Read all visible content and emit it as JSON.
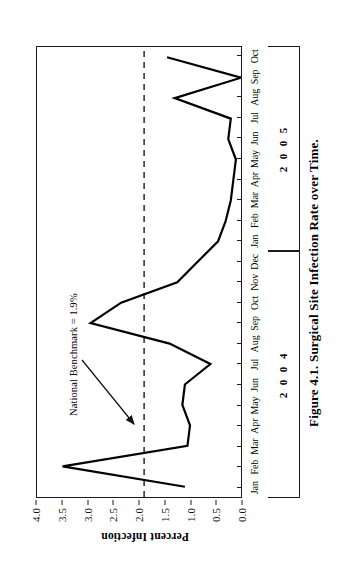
{
  "caption": "Figure 4.1.  Surgical Site Infection Rate over Time.",
  "axes": {
    "y_title": "Percent Infection",
    "y_ticks": [
      "0.0",
      "0.5",
      "1.0",
      "1.5",
      "2.0",
      "2.5",
      "3.0",
      "3.5",
      "4.0"
    ]
  },
  "annotation": {
    "benchmark_label": "National Benchmark = 1.9%"
  },
  "years": [
    {
      "label": "2 0 0 4",
      "months": 12
    },
    {
      "label": "2 0 0 5",
      "months": 10
    }
  ],
  "chart_data": {
    "type": "line",
    "title": "Surgical Site Infection Rate over Time",
    "xlabel": "",
    "ylabel": "Percent Infection",
    "ylim": [
      0.0,
      4.0
    ],
    "ytick_step": 0.5,
    "grid": false,
    "legend": "none",
    "orientation": "rotated-90ccw",
    "line_color": "#000000",
    "line_width": 2.2,
    "categories": [
      "Jan 2004",
      "Feb 2004",
      "Mar 2004",
      "Apr 2004",
      "May 2004",
      "Jun 2004",
      "Jul 2004",
      "Aug 2004",
      "Sep 2004",
      "Oct 2004",
      "Nov 2004",
      "Dec 2004",
      "Jan 2005",
      "Feb 2005",
      "Mar 2005",
      "Apr 2005",
      "May 2005",
      "Jun 2005",
      "Jul 2005",
      "Aug 2005",
      "Sep 2005",
      "Oct 2005"
    ],
    "tick_labels": [
      "Jan",
      "Feb",
      "Mar",
      "Apr",
      "May",
      "Jun",
      "Jul",
      "Aug",
      "Sep",
      "Oct",
      "Nov",
      "Dec",
      "Jan",
      "Feb",
      "Mar",
      "Apr",
      "May",
      "Jun",
      "Jul",
      "Aug",
      "Sep",
      "Oct"
    ],
    "values": [
      1.1,
      3.5,
      1.05,
      1.0,
      1.15,
      1.1,
      0.6,
      1.4,
      2.95,
      2.35,
      1.25,
      0.85,
      0.45,
      0.3,
      0.2,
      0.15,
      0.1,
      0.25,
      0.2,
      1.3,
      0.0,
      1.45
    ],
    "reference_line": {
      "label": "National Benchmark = 1.9%",
      "value": 1.9,
      "style": "dashed",
      "color": "#1a1a1a"
    }
  }
}
